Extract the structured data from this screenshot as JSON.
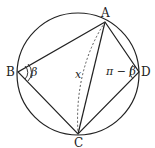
{
  "diagram": {
    "type": "cyclic-quadrilateral",
    "circle": {
      "cx": 78,
      "cy": 74,
      "r": 61
    },
    "points": {
      "A": {
        "label": "A",
        "x": 105,
        "y": 22
      },
      "B": {
        "label": "B",
        "x": 18,
        "y": 72
      },
      "C": {
        "label": "C",
        "x": 78,
        "y": 134
      },
      "D": {
        "label": "D",
        "x": 139,
        "y": 72
      }
    },
    "segments": [
      "AB",
      "BC",
      "CD",
      "DA",
      "AC"
    ],
    "arc_label": "x",
    "angle_B_label": "β",
    "angle_D_label": "π − β",
    "colors": {
      "stroke": "#222222",
      "background": "#ffffff"
    }
  }
}
